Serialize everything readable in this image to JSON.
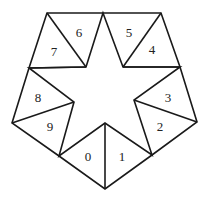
{
  "diagram": {
    "colors": {
      "stroke": "#1a1a1a",
      "background": "#ffffff",
      "label": "#222222"
    },
    "labels": [
      {
        "id": "0",
        "text": "0",
        "x": 88,
        "y": 156
      },
      {
        "id": "1",
        "text": "1",
        "x": 122,
        "y": 156
      },
      {
        "id": "2",
        "text": "2",
        "x": 160,
        "y": 126
      },
      {
        "id": "3",
        "text": "3",
        "x": 168,
        "y": 97
      },
      {
        "id": "4",
        "text": "4",
        "x": 152,
        "y": 49
      },
      {
        "id": "5",
        "text": "5",
        "x": 129,
        "y": 32
      },
      {
        "id": "6",
        "text": "6",
        "x": 79,
        "y": 32
      },
      {
        "id": "7",
        "text": "7",
        "x": 54,
        "y": 51
      },
      {
        "id": "8",
        "text": "8",
        "x": 38,
        "y": 97
      },
      {
        "id": "9",
        "text": "9",
        "x": 50,
        "y": 126
      }
    ]
  }
}
